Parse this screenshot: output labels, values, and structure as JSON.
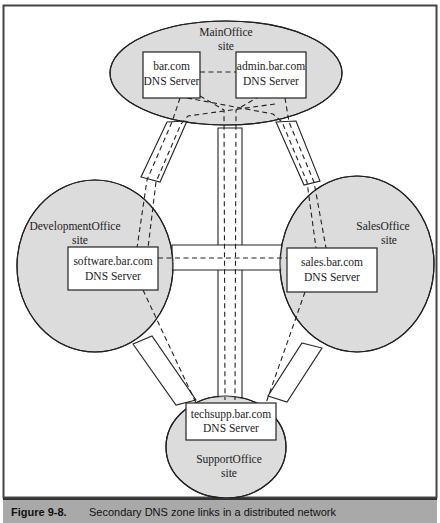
{
  "figure": {
    "caption_number": "Figure 9-8.",
    "caption_text": "Secondary DNS zone links in a distributed network"
  },
  "sites": {
    "main": {
      "name": "MainOffice",
      "suffix": "site"
    },
    "development": {
      "name": "DevelopmentOffice",
      "suffix": "site"
    },
    "sales": {
      "name": "SalesOffice",
      "suffix": "site"
    },
    "support": {
      "name": "SupportOffice",
      "suffix": "site"
    }
  },
  "servers": {
    "bar": {
      "domain": "bar.com",
      "role": "DNS Server"
    },
    "admin": {
      "domain": "admin.bar.com",
      "role": "DNS Server"
    },
    "software": {
      "domain": "software.bar.com",
      "role": "DNS Server"
    },
    "sales": {
      "domain": "sales.bar.com",
      "role": "DNS Server"
    },
    "techsupp": {
      "domain": "techsupp.bar.com",
      "role": "DNS Server"
    }
  },
  "colors": {
    "site_fill": "#dcdcdc",
    "line": "#222222",
    "caption_bg": "#a9a9a9"
  }
}
